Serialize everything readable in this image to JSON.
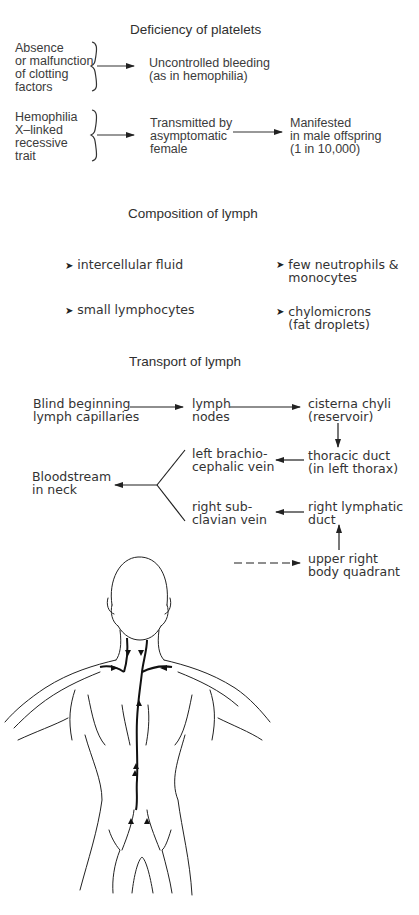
{
  "deficiency": {
    "title": "Deficiency of platelets",
    "row1": {
      "cause": "Absence\nor malfunction\nof clotting\nfactors",
      "effect": "Uncontrolled bleeding\n(as in hemophilia)"
    },
    "row2": {
      "cause": "Hemophilia\nX–linked\nrecessive\ntrait",
      "step": "Transmitted by\nasymptomatic\nfemale",
      "result": "Manifested\nin male offspring\n(1 in 10,000)"
    }
  },
  "composition": {
    "title": "Composition of lymph",
    "items": [
      {
        "label": "intercellular fluid"
      },
      {
        "label": "few neutrophils &\nmonocytes"
      },
      {
        "label": "small lymphocytes"
      },
      {
        "label": "chylomicrons\n(fat droplets)"
      }
    ],
    "bullet_glyph": "➤"
  },
  "transport": {
    "title": "Transport of lymph",
    "nodes": {
      "capillaries": "Blind beginning\nlymph capillaries",
      "lymph_nodes": "lymph\nnodes",
      "cisterna": "cisterna chyli\n(reservoir)",
      "thoracic": "thoracic duct\n(in left thorax)",
      "brachio": "left brachio-\ncephalic vein",
      "bloodstream": "Bloodstream\nin neck",
      "subclavian": "right sub-\nclavian vein",
      "right_duct": "right lymphatic\nduct",
      "quadrant": "upper right\nbody quadrant"
    }
  },
  "illustration": {
    "subject": "back view of human torso showing lymphatic drainage"
  }
}
